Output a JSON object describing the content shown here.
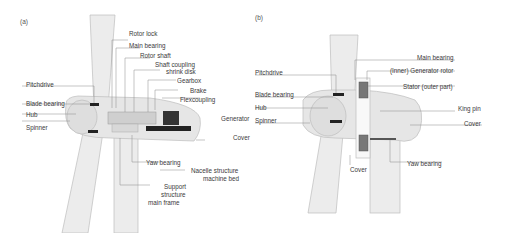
{
  "panel_a": {
    "tag": "(a)",
    "labels": {
      "rotor_lock": "Rotor lock",
      "main_bearing": "Main bearing",
      "rotor_shaft": "Rotor shaft",
      "shaft_coupling_1": "Shaft coupling",
      "shaft_coupling_2": "shrink disk",
      "gearbox": "Gearbox",
      "brake": "Brake",
      "flexcoupling": "Flexcoupling",
      "pitchdrive": "Pitchdrive",
      "blade_bearing": "Blade bearing",
      "hub": "Hub",
      "spinner": "Spinner",
      "generator": "Generator",
      "cover": "Cover",
      "yaw_bearing": "Yaw bearing",
      "nacelle_1": "Nacelle structure",
      "nacelle_2": "machine bed",
      "support_1": "Support",
      "support_2": "structure",
      "support_3": "main frame"
    }
  },
  "panel_b": {
    "tag": "(b)",
    "labels": {
      "main_bearing": "Main bearing",
      "generator_rotor": "(Inner) Generator rotor",
      "stator": "Stator (outer part)",
      "pitchdrive": "Pitchdrive",
      "blade_bearing": "Blade bearing",
      "hub": "Hub",
      "king_pin": "King pin",
      "spinner": "Spinner",
      "cover_right": "Cover",
      "yaw_bearing": "Yaw bearing",
      "cover_bottom": "Cover"
    }
  },
  "colors": {
    "body_fill": "#e9e9e9",
    "body_stroke": "#b5b5b5",
    "leader": "#888888",
    "component_dark": "#222222"
  }
}
